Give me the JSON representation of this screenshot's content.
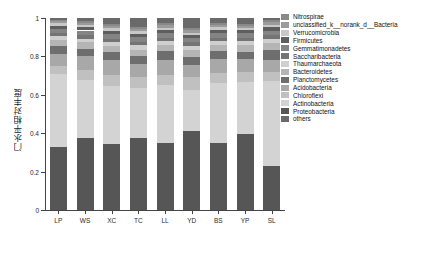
{
  "chart_data": {
    "type": "bar",
    "subtype": "stacked-bar-100",
    "title": "",
    "xlabel": "",
    "ylabel": "门水平相对丰度",
    "ylim": [
      0,
      1
    ],
    "yticks": [
      0,
      0.2,
      0.4,
      0.6,
      0.8,
      1
    ],
    "ytick_labels": [
      "0",
      "0.2",
      "0.4",
      "0.6",
      "0.8",
      "1"
    ],
    "grid": false,
    "legend_position": "right",
    "categories": [
      "LP",
      "WS",
      "XC",
      "TC",
      "LL",
      "YD",
      "BS",
      "YP",
      "SL"
    ],
    "series": [
      {
        "name": "Proteobacteria",
        "color": "#565656",
        "values": [
          0.33,
          0.375,
          0.345,
          0.375,
          0.35,
          0.41,
          0.35,
          0.395,
          0.23
        ]
      },
      {
        "name": "Actinobacteria",
        "color": "#d3d3d3",
        "values": [
          0.38,
          0.3,
          0.3,
          0.26,
          0.3,
          0.215,
          0.31,
          0.27,
          0.44
        ]
      },
      {
        "name": "Chloroflexi",
        "color": "#c0c0c0",
        "values": [
          0.04,
          0.055,
          0.06,
          0.06,
          0.055,
          0.07,
          0.055,
          0.055,
          0.05
        ]
      },
      {
        "name": "Acidobacteria",
        "color": "#a8a8a8",
        "values": [
          0.065,
          0.07,
          0.075,
          0.065,
          0.075,
          0.06,
          0.07,
          0.065,
          0.06
        ]
      },
      {
        "name": "Planctomycetes",
        "color": "#6e6e6e",
        "values": [
          0.04,
          0.04,
          0.045,
          0.04,
          0.05,
          0.04,
          0.045,
          0.04,
          0.055
        ]
      },
      {
        "name": "Bacteroidetes",
        "color": "#b5b5b5",
        "values": [
          0.03,
          0.035,
          0.03,
          0.035,
          0.03,
          0.04,
          0.03,
          0.035,
          0.035
        ]
      },
      {
        "name": "Thaumarchaeota",
        "color": "#cfcfcf",
        "values": [
          0.02,
          0.018,
          0.02,
          0.022,
          0.02,
          0.018,
          0.02,
          0.02,
          0.022
        ]
      },
      {
        "name": "Saccharibacteria",
        "color": "#747474",
        "values": [
          0.018,
          0.02,
          0.018,
          0.02,
          0.018,
          0.02,
          0.018,
          0.018,
          0.02
        ]
      },
      {
        "name": "Gemmatimonadetes",
        "color": "#848484",
        "values": [
          0.022,
          0.022,
          0.024,
          0.022,
          0.024,
          0.022,
          0.024,
          0.022,
          0.022
        ]
      },
      {
        "name": "Firmicutes",
        "color": "#5e5e5e",
        "values": [
          0.015,
          0.016,
          0.015,
          0.018,
          0.016,
          0.016,
          0.015,
          0.016,
          0.018
        ]
      },
      {
        "name": "Verrucomicrobia",
        "color": "#c8c8c8",
        "values": [
          0.012,
          0.013,
          0.014,
          0.013,
          0.012,
          0.013,
          0.014,
          0.012,
          0.013
        ]
      },
      {
        "name": "unclassified_k__norank_d__Bacteria",
        "color": "#9b9b9b",
        "values": [
          0.012,
          0.012,
          0.012,
          0.014,
          0.013,
          0.012,
          0.013,
          0.012,
          0.014
        ]
      },
      {
        "name": "Nitrospirae",
        "color": "#898989",
        "values": [
          0.008,
          0.01,
          0.01,
          0.01,
          0.01,
          0.01,
          0.01,
          0.01,
          0.009
        ]
      },
      {
        "name": "others",
        "color": "#6a6a6a",
        "values": [
          0.008,
          0.014,
          0.032,
          0.046,
          0.027,
          0.054,
          0.026,
          0.03,
          0.012
        ]
      }
    ]
  },
  "legend": {
    "items": [
      {
        "label": "Nitrospirae",
        "color": "#898989"
      },
      {
        "label": "unclassified_k__norank_d__Bacteria",
        "color": "#9b9b9b"
      },
      {
        "label": "Verrucomicrobia",
        "color": "#c8c8c8"
      },
      {
        "label": "Firmicutes",
        "color": "#5e5e5e"
      },
      {
        "label": "Gemmatimonadetes",
        "color": "#848484"
      },
      {
        "label": "Saccharibacteria",
        "color": "#747474"
      },
      {
        "label": "Thaumarchaeota",
        "color": "#cfcfcf"
      },
      {
        "label": "Bacteroidetes",
        "color": "#b5b5b5"
      },
      {
        "label": "Planctomycetes",
        "color": "#6e6e6e"
      },
      {
        "label": "Acidobacteria",
        "color": "#a8a8a8"
      },
      {
        "label": "Chloroflexi",
        "color": "#c0c0c0"
      },
      {
        "label": "Actinobacteria",
        "color": "#d3d3d3"
      },
      {
        "label": "Proteobacteria",
        "color": "#565656"
      },
      {
        "label": "others",
        "color": "#6a6a6a"
      }
    ]
  }
}
